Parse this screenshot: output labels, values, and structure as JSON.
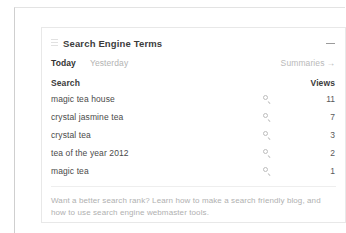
{
  "card": {
    "title": "Search Engine Terms",
    "grip_icon": "drag-handle-icon",
    "collapse_icon": "minus-collapse-icon",
    "tabs": [
      {
        "label": "Today",
        "active": true
      },
      {
        "label": "Yesterday",
        "active": false
      }
    ],
    "summaries": {
      "label": "Summaries",
      "arrow": "→"
    },
    "table": {
      "columns": [
        "Search",
        "Views"
      ],
      "row_icon": "search-magnifier-icon",
      "rows": [
        {
          "term": "magic tea house",
          "views": "11"
        },
        {
          "term": "crystal jasmine tea",
          "views": "7"
        },
        {
          "term": "crystal tea",
          "views": "3"
        },
        {
          "term": "tea of the year 2012",
          "views": "2"
        },
        {
          "term": "magic tea",
          "views": "1"
        }
      ]
    },
    "footer": "Want a better search rank? Learn how to make a search friendly blog, and how to use search engine webmaster tools."
  },
  "colors": {
    "card_border": "#e8e8e8",
    "title_text": "#3c3c3c",
    "muted_text": "#b3b3b3",
    "footer_text": "#b0b0b0",
    "row_text": "#4a4a4a"
  }
}
